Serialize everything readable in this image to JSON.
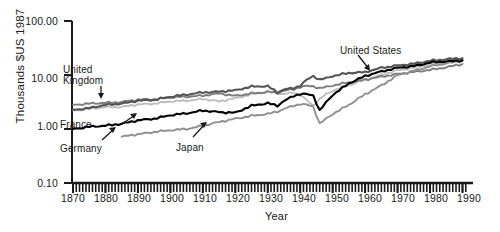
{
  "figure": {
    "ylabel": "Thousands $US 1987",
    "xlabel": "Year",
    "ytick_labels": [
      "100.00",
      "10.00",
      "1.00",
      "0.10"
    ],
    "xtick_labels": [
      "1870",
      "1880",
      "1890",
      "1900",
      "1910",
      "1920",
      "1930",
      "1940",
      "1950",
      "1960",
      "1970",
      "1980",
      "1990"
    ],
    "annotations": {
      "united_states": "United States",
      "united_kingdom_line1": "United",
      "united_kingdom_line2": "Kingdom",
      "france": "France",
      "germany": "Germany",
      "japan": "Japan"
    },
    "colors": {
      "united_states": "#555555",
      "united_kingdom": "#7d7d7d",
      "france": "#bdbdbd",
      "germany": "#000000",
      "japan": "#909090",
      "axis": "#1a1a1a"
    }
  },
  "chart_data": {
    "type": "line",
    "title": "",
    "xlabel": "Year",
    "ylabel": "Thousands $US 1987",
    "yscale": "log",
    "ylim": [
      0.1,
      100.0
    ],
    "xlim": [
      1870,
      1992
    ],
    "ytick_values": [
      100.0,
      10.0,
      1.0,
      0.1
    ],
    "xtick_values": [
      1870,
      1880,
      1890,
      1900,
      1910,
      1920,
      1930,
      1940,
      1950,
      1960,
      1970,
      1980,
      1990
    ],
    "minor_xticks": "annual",
    "grid": false,
    "legend": "inline-annotations",
    "series": [
      {
        "name": "United States",
        "color": "#555555",
        "x": [
          1870,
          1875,
          1880,
          1885,
          1890,
          1895,
          1900,
          1905,
          1910,
          1915,
          1920,
          1925,
          1930,
          1933,
          1935,
          1938,
          1940,
          1942,
          1944,
          1946,
          1948,
          1950,
          1955,
          1960,
          1965,
          1970,
          1975,
          1980,
          1985,
          1990
        ],
        "values": [
          2.25,
          2.45,
          2.8,
          2.95,
          3.35,
          3.45,
          3.95,
          4.35,
          4.75,
          4.9,
          5.2,
          6.1,
          6.2,
          4.8,
          5.4,
          5.7,
          6.4,
          8.1,
          9.6,
          8.2,
          8.7,
          9.6,
          10.9,
          11.3,
          13.6,
          15.0,
          16.2,
          18.3,
          19.6,
          20.5
        ]
      },
      {
        "name": "United Kingdom",
        "color": "#7d7d7d",
        "x": [
          1870,
          1875,
          1880,
          1885,
          1890,
          1895,
          1900,
          1905,
          1910,
          1915,
          1920,
          1925,
          1930,
          1933,
          1935,
          1938,
          1940,
          1942,
          1944,
          1946,
          1948,
          1950,
          1955,
          1960,
          1965,
          1970,
          1975,
          1980,
          1985,
          1990
        ],
        "values": [
          2.8,
          2.95,
          3.05,
          3.15,
          3.5,
          3.55,
          3.85,
          3.95,
          4.15,
          4.55,
          4.1,
          4.55,
          4.85,
          4.7,
          5.1,
          5.45,
          6.0,
          6.25,
          6.2,
          5.7,
          6.0,
          6.4,
          7.3,
          8.2,
          9.3,
          10.4,
          11.4,
          12.4,
          13.9,
          16.0
        ]
      },
      {
        "name": "France",
        "color": "#bdbdbd",
        "x": [
          1870,
          1875,
          1880,
          1885,
          1890,
          1895,
          1900,
          1905,
          1910,
          1915,
          1920,
          1925,
          1930,
          1933,
          1935,
          1938,
          1940,
          1942,
          1944,
          1946,
          1948,
          1950,
          1955,
          1960,
          1965,
          1970,
          1975,
          1980,
          1985,
          1990
        ],
        "values": [
          2.2,
          2.35,
          2.55,
          2.55,
          2.85,
          2.95,
          3.25,
          3.35,
          3.6,
          3.25,
          3.7,
          4.4,
          4.9,
          4.6,
          4.45,
          4.7,
          4.3,
          3.4,
          2.7,
          3.6,
          4.4,
          5.1,
          6.5,
          8.1,
          10.0,
          12.3,
          13.6,
          15.6,
          16.4,
          18.3
        ]
      },
      {
        "name": "Germany",
        "color": "#000000",
        "x": [
          1870,
          1875,
          1880,
          1885,
          1890,
          1895,
          1900,
          1905,
          1910,
          1915,
          1920,
          1925,
          1930,
          1933,
          1935,
          1938,
          1940,
          1942,
          1944,
          1946,
          1948,
          1950,
          1955,
          1960,
          1965,
          1970,
          1975,
          1980,
          1985,
          1990
        ],
        "values": [
          1.0,
          1.1,
          1.15,
          1.25,
          1.45,
          1.55,
          1.8,
          1.95,
          2.2,
          2.05,
          2.0,
          2.7,
          3.0,
          2.7,
          3.3,
          4.1,
          4.45,
          4.4,
          4.2,
          2.2,
          3.1,
          4.3,
          7.0,
          9.6,
          11.6,
          13.6,
          14.6,
          17.0,
          17.8,
          18.7
        ]
      },
      {
        "name": "Japan",
        "color": "#909090",
        "x": [
          1885,
          1890,
          1895,
          1900,
          1905,
          1910,
          1915,
          1920,
          1925,
          1930,
          1933,
          1935,
          1938,
          1940,
          1942,
          1944,
          1946,
          1948,
          1950,
          1955,
          1960,
          1965,
          1970,
          1975,
          1980,
          1985,
          1990
        ],
        "values": [
          0.72,
          0.8,
          0.88,
          0.95,
          1.0,
          1.15,
          1.35,
          1.55,
          1.75,
          1.9,
          2.1,
          2.35,
          2.7,
          2.9,
          2.8,
          2.6,
          1.25,
          1.55,
          1.9,
          2.8,
          4.4,
          6.4,
          9.9,
          12.0,
          14.4,
          16.4,
          18.6
        ]
      }
    ]
  }
}
